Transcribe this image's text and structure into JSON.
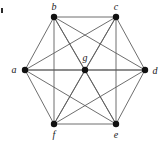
{
  "figure": {
    "background_color": "#ffffff",
    "width": 162,
    "height": 152,
    "corner_mark": {
      "name": "figure-corner-mark",
      "x": 1,
      "y": 8,
      "width": 2,
      "height": 5,
      "color": "#2b2b2b"
    }
  },
  "graph_data": {
    "type": "graph",
    "layout": "hexagon-with-center",
    "vertex_color": "#111111",
    "vertex_radius": 3.2,
    "edge_color": "#5d5d5d",
    "edge_width": 0.9,
    "label_color": "#1a1a1a",
    "label_font_size": 10,
    "nodes": [
      {
        "id": "a",
        "label": "a",
        "x": 25,
        "y": 70,
        "label_x": 14,
        "label_y": 70
      },
      {
        "id": "b",
        "label": "b",
        "x": 54,
        "y": 17,
        "label_x": 54,
        "label_y": 7
      },
      {
        "id": "c",
        "label": "c",
        "x": 116,
        "y": 17,
        "label_x": 116,
        "label_y": 7
      },
      {
        "id": "d",
        "label": "d",
        "x": 145,
        "y": 70,
        "label_x": 155,
        "label_y": 71
      },
      {
        "id": "e",
        "label": "e",
        "x": 116,
        "y": 124,
        "label_x": 116,
        "label_y": 135
      },
      {
        "id": "f",
        "label": "f",
        "x": 54,
        "y": 124,
        "label_x": 54,
        "label_y": 135
      },
      {
        "id": "g",
        "label": "g",
        "x": 85,
        "y": 70,
        "label_x": 85,
        "label_y": 58
      }
    ],
    "edges": [
      [
        "a",
        "b"
      ],
      [
        "a",
        "c"
      ],
      [
        "a",
        "d"
      ],
      [
        "a",
        "e"
      ],
      [
        "a",
        "f"
      ],
      [
        "a",
        "g"
      ],
      [
        "b",
        "c"
      ],
      [
        "b",
        "d"
      ],
      [
        "b",
        "e"
      ],
      [
        "b",
        "f"
      ],
      [
        "b",
        "g"
      ],
      [
        "c",
        "d"
      ],
      [
        "c",
        "e"
      ],
      [
        "c",
        "f"
      ],
      [
        "c",
        "g"
      ],
      [
        "d",
        "e"
      ],
      [
        "d",
        "f"
      ],
      [
        "d",
        "g"
      ],
      [
        "e",
        "f"
      ],
      [
        "e",
        "g"
      ],
      [
        "f",
        "g"
      ]
    ],
    "node_count": 7,
    "edge_count": 21
  }
}
